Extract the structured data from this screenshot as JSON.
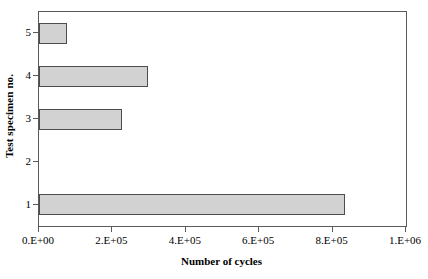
{
  "chart_data": {
    "type": "bar",
    "orientation": "horizontal",
    "title": "",
    "xlabel": "Number of cycles",
    "ylabel": "Test specimen no.",
    "categories": [
      "1",
      "2",
      "3",
      "4",
      "5"
    ],
    "values": [
      834000,
      0,
      226000,
      297000,
      76000
    ],
    "series": [
      {
        "name": "Number of cycles",
        "values": [
          834000,
          0,
          226000,
          297000,
          76000
        ]
      }
    ],
    "xlim": [
      0,
      1000000
    ],
    "ylim_categories": [
      "1",
      "2",
      "3",
      "4",
      "5"
    ],
    "x_ticks": [
      0,
      200000,
      400000,
      600000,
      800000,
      1000000
    ],
    "x_tick_labels": [
      "0.E+00",
      "2.E+05",
      "4.E+05",
      "6.E+05",
      "8.E+05",
      "1.E+06"
    ],
    "y_tick_labels": [
      "5",
      "4",
      "3",
      "2",
      "1"
    ],
    "grid": false,
    "legend": "none",
    "bar_fill_color": "#d2d2d2",
    "bar_border_color": "#4d4d4d",
    "axis_color": "#5a5a5a",
    "background_color": "#ffffff"
  },
  "axes": {
    "x_title": "Number of cycles",
    "y_title": "Test specimen no."
  }
}
